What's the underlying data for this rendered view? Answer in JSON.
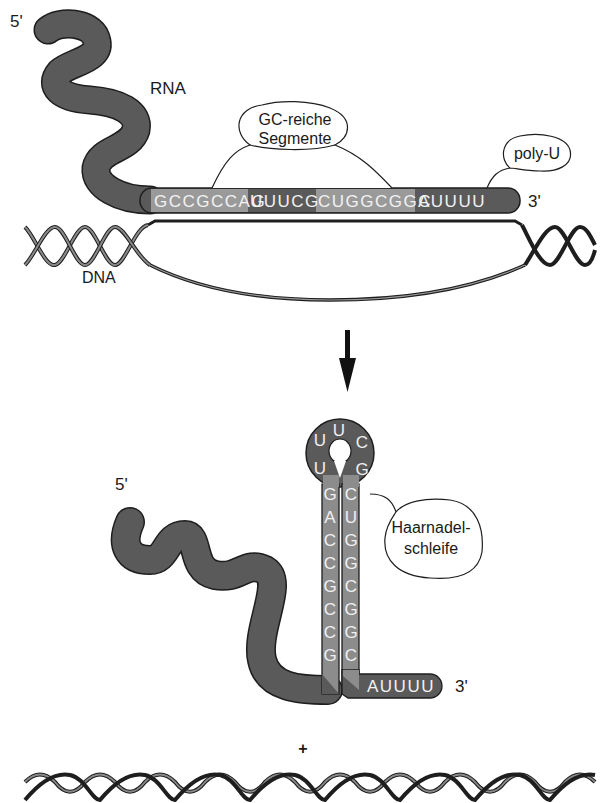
{
  "colors": {
    "rna_dark": "#5a5a5a",
    "gc_segment": "#9a9a9a",
    "stem_fill": "#8c8c8c",
    "outline": "#1e1e1e",
    "text": "#1a1a1a",
    "background": "#ffffff"
  },
  "top_panel": {
    "five_prime": "5'",
    "rna_label": "RNA",
    "callout_gc": {
      "line1": "GC-reiche",
      "line2": "Segmente"
    },
    "callout_polyu": "poly-U",
    "sequence_segments": [
      {
        "text": "GCCGCCAG",
        "type": "gc"
      },
      {
        "text": "UUUCG",
        "type": "spacer"
      },
      {
        "text": "CUGGCGGC",
        "type": "gc"
      },
      {
        "text": "AUUUU",
        "type": "polyu"
      }
    ],
    "three_prime": "3'",
    "dna_label": "DNA"
  },
  "arrow": {
    "direction": "down"
  },
  "bottom_panel": {
    "five_prime": "5'",
    "loop_bases": [
      "U",
      "U",
      "U",
      "C",
      "G"
    ],
    "left_stem": [
      "G",
      "A",
      "C",
      "C",
      "G",
      "C",
      "C",
      "G"
    ],
    "right_stem": [
      "C",
      "U",
      "G",
      "G",
      "C",
      "G",
      "G",
      "C"
    ],
    "tail": "AUUUU",
    "three_prime": "3'",
    "callout_hairpin": {
      "line1": "Haarnadel-",
      "line2": "schleife"
    },
    "plus_sign": "+"
  }
}
